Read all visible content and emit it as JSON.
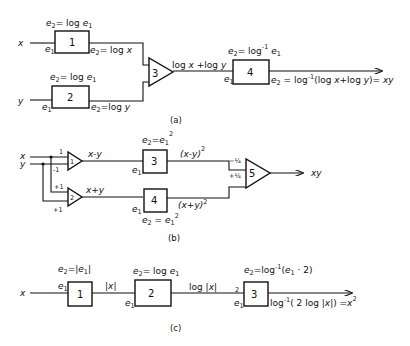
{
  "diagram_a": {
    "caption": "(a)",
    "inputs": {
      "x": "x",
      "y": "y"
    },
    "block1": {
      "id": "1",
      "func": "e2= log e1",
      "in_label": "e1",
      "out_label": "e2= log x"
    },
    "block2": {
      "id": "2",
      "func": "e2= log e1",
      "in_label": "e1",
      "out_label": "e2=log y"
    },
    "summer3": {
      "id": "3",
      "out_label": "log x +log y"
    },
    "block4": {
      "id": "4",
      "func": "e2= log^-1 e1",
      "in_label": "e1",
      "out_label": "e2 = log^-1(log x+log y)= xy"
    }
  },
  "diagram_b": {
    "caption": "(b)",
    "inputs": {
      "x": "x",
      "y": "y"
    },
    "amp1": {
      "id": "1",
      "gain_top": "1",
      "gain_bottom": "-1",
      "out_label": "x-y"
    },
    "amp2": {
      "id": "2",
      "gain_top": "+1",
      "gain_bottom": "+1",
      "out_label": "x+y"
    },
    "block3": {
      "id": "3",
      "func": "e2=e1^2",
      "in_label": "e1",
      "out_label": "(x-y)^2"
    },
    "block4": {
      "id": "4",
      "func": "e2 = e1^2",
      "in_label": "e1",
      "out_label": "(x+y)^2"
    },
    "summer5": {
      "id": "5",
      "gain_top": "-1/4",
      "gain_bottom": "+1/4",
      "out_label": "xy"
    }
  },
  "diagram_c": {
    "caption": "(c)",
    "input": "x",
    "block1": {
      "id": "1",
      "func": "e2=|e1|",
      "in_label": "e1",
      "out_label": "|x|"
    },
    "block2": {
      "id": "2",
      "func": "e2= log e1",
      "in_label": "e1",
      "out_label": "log |x|"
    },
    "block3": {
      "id": "3",
      "func": "e2=log^-1(e1 · 2)",
      "in_label_top": "2",
      "in_label": "e1",
      "out_label": "log^-1(2 log|x|) =x^2"
    }
  }
}
